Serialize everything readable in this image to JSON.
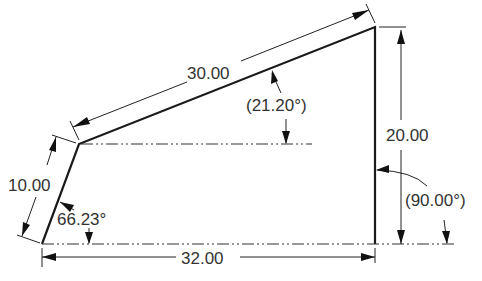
{
  "diagram": {
    "type": "engineering-drawing",
    "shape": "quadrilateral",
    "dimensions": {
      "top_edge_length": "30.00",
      "top_edge_angle": "(21.20°)",
      "right_edge_height": "20.00",
      "right_angle": "(90.00°)",
      "left_edge_length": "10.00",
      "left_angle": "66.23°",
      "bottom_edge_length": "32.00"
    },
    "colors": {
      "line": "#1a1a1a",
      "text": "#333333",
      "background": "#ffffff"
    }
  }
}
